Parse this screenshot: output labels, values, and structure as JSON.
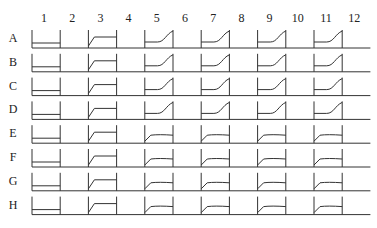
{
  "columns": [
    "1",
    "2",
    "3",
    "4",
    "5",
    "6",
    "7",
    "8",
    "9",
    "10",
    "11",
    "12"
  ],
  "rows": [
    "A",
    "B",
    "C",
    "D",
    "E",
    "F",
    "G",
    "H"
  ],
  "layout": {
    "x0": 32,
    "colPitch": 28.2,
    "y0": 40,
    "rowPitch": 23.8,
    "wellH": 18
  },
  "curve_types": {
    "flat": "flat low line (no growth)",
    "empty": "no curve",
    "plateau": "fast rise then plateau",
    "sigmoid": "lag then exponential rise",
    "plateau_low": "fast rise, lower plateau"
  },
  "wells": {
    "A": [
      "flat",
      "empty",
      "plateau",
      "empty",
      "sigmoid",
      "empty",
      "sigmoid",
      "empty",
      "sigmoid",
      "empty",
      "sigmoid",
      "empty"
    ],
    "B": [
      "flat",
      "empty",
      "plateau",
      "empty",
      "sigmoid",
      "empty",
      "sigmoid",
      "empty",
      "sigmoid",
      "empty",
      "sigmoid",
      "empty"
    ],
    "C": [
      "flat",
      "empty",
      "plateau",
      "empty",
      "sigmoid",
      "empty",
      "sigmoid",
      "empty",
      "sigmoid",
      "empty",
      "sigmoid",
      "empty"
    ],
    "D": [
      "flat",
      "empty",
      "plateau",
      "empty",
      "sigmoid",
      "empty",
      "sigmoid",
      "empty",
      "sigmoid",
      "empty",
      "sigmoid",
      "empty"
    ],
    "E": [
      "flat",
      "empty",
      "plateau",
      "empty",
      "plateau_low",
      "empty",
      "plateau_low",
      "empty",
      "plateau_low",
      "empty",
      "plateau_low",
      "empty"
    ],
    "F": [
      "flat",
      "empty",
      "plateau",
      "empty",
      "plateau_low",
      "empty",
      "plateau_low",
      "empty",
      "plateau_low",
      "empty",
      "plateau_low",
      "empty"
    ],
    "G": [
      "flat",
      "empty",
      "plateau",
      "empty",
      "plateau_low",
      "empty",
      "plateau_low",
      "empty",
      "plateau_low",
      "empty",
      "plateau_low",
      "empty"
    ],
    "H": [
      "flat",
      "empty",
      "plateau",
      "empty",
      "plateau_low",
      "empty",
      "plateau_low",
      "empty",
      "plateau_low",
      "empty",
      "plateau_low",
      "empty"
    ]
  },
  "colors": {
    "line": "#333333",
    "text": "#222222"
  }
}
